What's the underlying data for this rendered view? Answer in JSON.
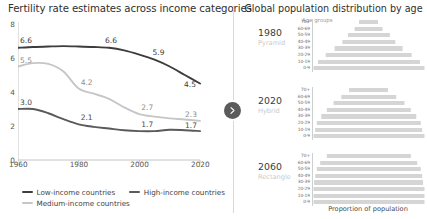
{
  "left": {
    "title": "Fertility rate estimates across income categories",
    "legend": [
      {
        "label": "Low-income countries",
        "color": "#3d3d3d"
      },
      {
        "label": "High-income countries",
        "color": "#5a5a5a"
      },
      {
        "label": "Medium-income countries",
        "color": "#c6c6c6"
      }
    ]
  },
  "right": {
    "title": "Global population distribution by age",
    "age_groups_caption": "Age groups",
    "xaxis_caption": "Proportion of population",
    "panels": [
      {
        "year": "1980",
        "shape": "Pyramid"
      },
      {
        "year": "2020",
        "shape": "Hybrid"
      },
      {
        "year": "2060",
        "shape": "Rectangle"
      }
    ]
  },
  "divider": {
    "knob_icon": "chevron-right-icon",
    "knob_color": "#5b5b5b"
  },
  "chart_data": [
    {
      "type": "line",
      "title": "Fertility rate estimates across income categories",
      "xlabel": "",
      "ylabel": "",
      "xlim": [
        1960,
        2020
      ],
      "ylim": [
        0,
        8
      ],
      "yticks": [
        "0",
        "2",
        "4",
        "6",
        "8"
      ],
      "ytick_values": [
        0,
        2,
        4,
        6,
        8
      ],
      "xticks": [
        "1960",
        "1980",
        "2000",
        "2020"
      ],
      "xtick_values": [
        1960,
        1980,
        2000,
        2020
      ],
      "grid": false,
      "legend_position": "bottom-left",
      "x": [
        1960,
        1965,
        1970,
        1975,
        1980,
        1985,
        1990,
        1995,
        2000,
        2005,
        2010,
        2015,
        2020
      ],
      "series": [
        {
          "name": "Low-income countries",
          "color": "#3d3d3d",
          "values": [
            6.6,
            6.65,
            6.68,
            6.7,
            6.68,
            6.65,
            6.6,
            6.45,
            6.2,
            5.9,
            5.5,
            5.0,
            4.5
          ],
          "point_labels": [
            {
              "x": 1960,
              "value": 6.6,
              "text": "6.6"
            },
            {
              "x": 1990,
              "value": 6.6,
              "text": "6.6"
            },
            {
              "x": 2005,
              "value": 5.9,
              "text": "5.9"
            },
            {
              "x": 2020,
              "value": 4.5,
              "text": "4.5"
            }
          ]
        },
        {
          "name": "Medium-income countries",
          "color": "#c6c6c6",
          "values": [
            5.5,
            5.7,
            5.65,
            5.2,
            4.2,
            3.9,
            3.6,
            3.1,
            2.7,
            2.55,
            2.45,
            2.38,
            2.3
          ],
          "point_labels": [
            {
              "x": 1960,
              "value": 5.5,
              "text": "5.5"
            },
            {
              "x": 1980,
              "value": 4.2,
              "text": "4.2"
            },
            {
              "x": 2000,
              "value": 2.7,
              "text": "2.7"
            },
            {
              "x": 2020,
              "value": 2.3,
              "text": "2.3"
            }
          ]
        },
        {
          "name": "High-income countries",
          "color": "#5a5a5a",
          "values": [
            3.0,
            3.0,
            2.75,
            2.4,
            2.1,
            1.95,
            1.85,
            1.75,
            1.7,
            1.7,
            1.78,
            1.75,
            1.7
          ],
          "point_labels": [
            {
              "x": 1960,
              "value": 3.0,
              "text": "3.0"
            },
            {
              "x": 1980,
              "value": 2.1,
              "text": "2.1"
            },
            {
              "x": 2000,
              "value": 1.7,
              "text": "1.7"
            },
            {
              "x": 2020,
              "value": 1.7,
              "text": "1.7"
            }
          ]
        }
      ]
    },
    {
      "type": "bar",
      "title": "Global population distribution by age",
      "xlabel": "Proportion of population",
      "ylabel": "Age groups",
      "orientation": "horizontal-centered",
      "categories": [
        "70+",
        "60-69",
        "50-59",
        "40-49",
        "30-39",
        "20-29",
        "10-19",
        "0-9"
      ],
      "panels": [
        {
          "name": "1980",
          "shape": "Pyramid",
          "values": [
            18,
            26,
            38,
            48,
            62,
            78,
            92,
            100
          ]
        },
        {
          "name": "2020",
          "shape": "Hybrid",
          "values": [
            36,
            50,
            64,
            76,
            86,
            94,
            97,
            100
          ]
        },
        {
          "name": "2060",
          "shape": "Rectangle",
          "values": [
            76,
            88,
            94,
            97,
            99,
            100,
            100,
            100
          ]
        }
      ]
    }
  ]
}
